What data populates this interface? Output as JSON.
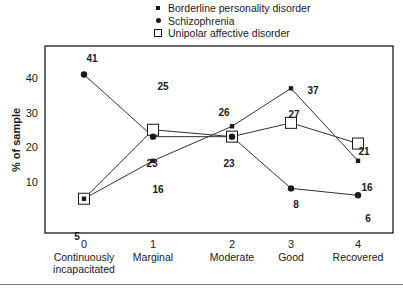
{
  "chart_data": {
    "type": "line",
    "title": "",
    "xlabel": "",
    "ylabel": "% of sample",
    "x": [
      0,
      1,
      2,
      3,
      4
    ],
    "categories": [
      {
        "tick": "0",
        "label_lines": [
          "Continuously",
          "incapacitated"
        ]
      },
      {
        "tick": "1",
        "label_lines": [
          "Marginal"
        ]
      },
      {
        "tick": "2",
        "label_lines": [
          "Moderate"
        ]
      },
      {
        "tick": "3",
        "label_lines": [
          "Good"
        ]
      },
      {
        "tick": "4",
        "label_lines": [
          "Recovered"
        ]
      }
    ],
    "yticks": [
      10,
      20,
      30,
      40
    ],
    "ylim": [
      0,
      50
    ],
    "grid": false,
    "legend_position": "top",
    "series": [
      {
        "name": "Borderline personality disorder",
        "marker": "small-filled-square",
        "values": [
          5,
          16,
          26,
          37,
          16
        ]
      },
      {
        "name": "Schizophrenia",
        "marker": "filled-circle",
        "values": [
          41,
          23,
          23,
          8,
          6
        ]
      },
      {
        "name": "Unipolar affective disorder",
        "marker": "open-square",
        "values": [
          5,
          25,
          23,
          27,
          21
        ]
      }
    ],
    "annotations": [
      {
        "text": "41",
        "series": "Schizophrenia",
        "x": 0
      },
      {
        "text": "5",
        "series": "Borderline/Unipolar",
        "x": 0
      },
      {
        "text": "25",
        "series": "Unipolar affective disorder",
        "x": 1
      },
      {
        "text": "23",
        "series": "Schizophrenia",
        "x": 1
      },
      {
        "text": "16",
        "series": "Borderline personality disorder",
        "x": 1
      },
      {
        "text": "26",
        "series": "Borderline personality disorder",
        "x": 2
      },
      {
        "text": "23",
        "series": "Schizophrenia/Unipolar",
        "x": 2
      },
      {
        "text": "37",
        "series": "Borderline personality disorder",
        "x": 3
      },
      {
        "text": "27",
        "series": "Unipolar affective disorder",
        "x": 3
      },
      {
        "text": "8",
        "series": "Schizophrenia",
        "x": 3
      },
      {
        "text": "21",
        "series": "Unipolar affective disorder",
        "x": 4
      },
      {
        "text": "16",
        "series": "Borderline personality disorder",
        "x": 4
      },
      {
        "text": "6",
        "series": "Schizophrenia",
        "x": 4
      }
    ]
  },
  "legend": {
    "items": [
      {
        "label": "Borderline personality disorder"
      },
      {
        "label": "Schizophrenia"
      },
      {
        "label": "Unipolar affective disorder"
      }
    ]
  }
}
